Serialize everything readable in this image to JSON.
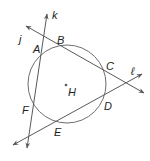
{
  "diagram": {
    "type": "geometry",
    "colors": {
      "stroke": "#58595b",
      "label": "#231f20",
      "background": "#ffffff"
    },
    "circle": {
      "center_label": "H",
      "cx": 67,
      "cy": 84,
      "r": 39
    },
    "lines": [
      {
        "name": "j",
        "label": "j",
        "x1": 26,
        "y1": 26,
        "x2": 144,
        "y2": 93
      },
      {
        "name": "k",
        "label": "k",
        "x1": 27,
        "y1": 148,
        "x2": 47,
        "y2": 14
      },
      {
        "name": "l",
        "label": "ℓ",
        "x1": 13,
        "y1": 145,
        "x2": 142,
        "y2": 74
      }
    ],
    "points": [
      {
        "label": "A",
        "x": 36,
        "y": 52
      },
      {
        "label": "B",
        "x": 55,
        "y": 45
      },
      {
        "label": "C",
        "x": 105,
        "y": 69
      },
      {
        "label": "D",
        "x": 104,
        "y": 108
      },
      {
        "label": "E",
        "x": 54,
        "y": 135
      },
      {
        "label": "F",
        "x": 22,
        "y": 113
      },
      {
        "label": "H",
        "x": 68,
        "y": 96
      }
    ],
    "line_labels": {
      "j": "j",
      "k": "k",
      "l": "ℓ"
    }
  }
}
